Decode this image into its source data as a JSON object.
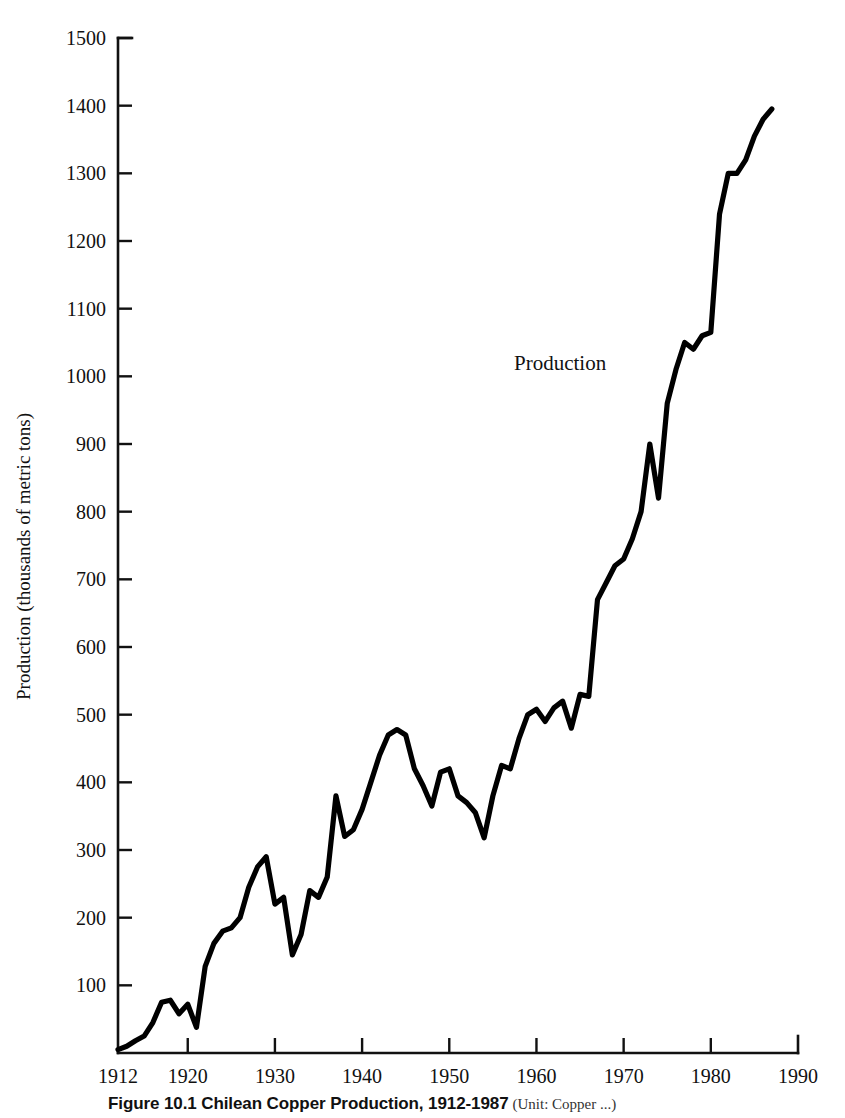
{
  "figure": {
    "caption_label": "Figure 10.1  Chilean Copper Production, 1912-1987",
    "caption_source": "(Unit: Copper ...)"
  },
  "chart_data": {
    "type": "line",
    "title": "Chilean Copper Production, 1912-1987",
    "xlabel": "",
    "ylabel": "Production (thousands of metric tons)",
    "xlim": [
      1912,
      1990
    ],
    "ylim": [
      0,
      1500
    ],
    "xticks": [
      1912,
      1920,
      1930,
      1940,
      1950,
      1960,
      1970,
      1980,
      1990
    ],
    "yticks": [
      100,
      200,
      300,
      400,
      500,
      600,
      700,
      800,
      900,
      1000,
      1100,
      1200,
      1300,
      1400,
      1500
    ],
    "grid": false,
    "legend": "none",
    "annotations": [
      {
        "text": "Production",
        "x": 1968,
        "y": 1010
      }
    ],
    "series": [
      {
        "name": "Production",
        "color": "#000000",
        "x": [
          1912,
          1913,
          1914,
          1915,
          1916,
          1917,
          1918,
          1919,
          1920,
          1921,
          1922,
          1923,
          1924,
          1925,
          1926,
          1927,
          1928,
          1929,
          1930,
          1931,
          1932,
          1933,
          1934,
          1935,
          1936,
          1937,
          1938,
          1939,
          1940,
          1941,
          1942,
          1943,
          1944,
          1945,
          1946,
          1947,
          1948,
          1949,
          1950,
          1951,
          1952,
          1953,
          1954,
          1955,
          1956,
          1957,
          1958,
          1959,
          1960,
          1961,
          1962,
          1963,
          1964,
          1965,
          1966,
          1967,
          1968,
          1969,
          1970,
          1971,
          1972,
          1973,
          1974,
          1975,
          1976,
          1977,
          1978,
          1979,
          1980,
          1981,
          1982,
          1983,
          1984,
          1985,
          1986,
          1987
        ],
        "y": [
          5,
          10,
          18,
          25,
          45,
          75,
          78,
          58,
          72,
          38,
          128,
          162,
          180,
          185,
          200,
          245,
          275,
          290,
          220,
          230,
          145,
          175,
          240,
          230,
          260,
          380,
          320,
          330,
          360,
          400,
          440,
          470,
          478,
          470,
          420,
          395,
          365,
          415,
          420,
          380,
          370,
          355,
          318,
          380,
          425,
          420,
          465,
          500,
          508,
          490,
          510,
          520,
          480,
          530,
          527,
          670,
          695,
          720,
          730,
          760,
          800,
          900,
          820,
          960,
          1010,
          1050,
          1040,
          1060,
          1065,
          1240,
          1300,
          1300,
          1320,
          1355,
          1380,
          1395
        ]
      }
    ]
  },
  "axis": {
    "y_title": "Production (thousands of metric tons)"
  }
}
